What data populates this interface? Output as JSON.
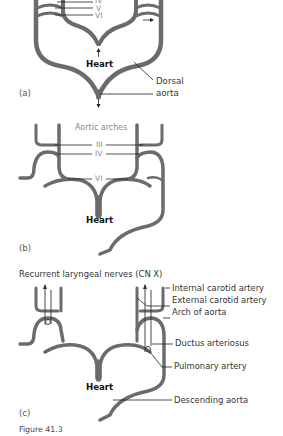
{
  "figure": {
    "caption": "Figure 41.3",
    "colors": {
      "vessel": "#6b6b6b",
      "leader": "#222222",
      "background": "#ffffff"
    }
  },
  "panel_a": {
    "tag": "(a)",
    "arch_labels": [
      "IV",
      "V",
      "VI"
    ],
    "heart_label": "Heart",
    "dorsal_aorta_label_line1": "Dorsal",
    "dorsal_aorta_label_line2": "aorta"
  },
  "panel_b": {
    "tag": "(b)",
    "title": "Aortic arches",
    "arch_labels": [
      "III",
      "IV",
      "VI"
    ],
    "heart_label": "Heart"
  },
  "panel_c": {
    "tag": "(c)",
    "nerve_label": "Recurrent laryngeal nerves (CN X)",
    "heart_label": "Heart",
    "labels": [
      "Internal carotid artery",
      "External carotid artery",
      "Arch of aorta",
      "Ductus arteriosus",
      "Pulmonary artery",
      "Descending aorta"
    ]
  }
}
